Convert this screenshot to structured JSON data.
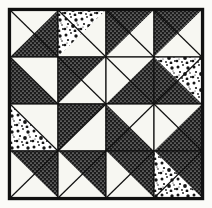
{
  "figure": {
    "title": "Pinwheel Star Quilt Block",
    "media": "black-and-white line drawing",
    "width": 212,
    "height": 208
  },
  "colors": {
    "background": "#fbfbf8",
    "dark_fabric": "#1c1c1c",
    "dark_fabric_dot": "#ffffff",
    "light_fabric": "#f7f7f2",
    "mottled_fabric_base": "#ffffff",
    "mottled_fabric_speck": "#161616",
    "seam_line": "#111111",
    "border_line": "#111111"
  },
  "block": {
    "grid_rows": 4,
    "grid_cols": 4,
    "unit_type": "half-square-triangle",
    "border_inset": 8,
    "border_width": 2,
    "inner_origin_x": 10,
    "inner_origin_y": 10,
    "inner_size": 192,
    "cell_size": 48,
    "center_motif": "pinwheel",
    "fabrics": [
      "dark",
      "light",
      "mottled"
    ],
    "units": [
      {
        "name": "unit-r0c0",
        "row": 0,
        "col": 0,
        "diagonal": "tlbr",
        "upper_fabric": "light",
        "lower_fabric": "dark"
      },
      {
        "name": "unit-r0c1",
        "row": 0,
        "col": 1,
        "diagonal": "tlbr",
        "upper_fabric": "mottled",
        "lower_fabric": "light"
      },
      {
        "name": "unit-r0c2",
        "row": 0,
        "col": 2,
        "diagonal": "tlbr",
        "upper_fabric": "dark",
        "lower_fabric": "light"
      },
      {
        "name": "unit-r0c3",
        "row": 0,
        "col": 3,
        "diagonal": "tlbr",
        "upper_fabric": "dark",
        "lower_fabric": "light"
      },
      {
        "name": "unit-r1c0",
        "row": 1,
        "col": 0,
        "diagonal": "tlbr",
        "upper_fabric": "light",
        "lower_fabric": "dark"
      },
      {
        "name": "unit-r1c1",
        "row": 1,
        "col": 1,
        "diagonal": "tlbr",
        "upper_fabric": "dark",
        "lower_fabric": "light"
      },
      {
        "name": "unit-r1c2",
        "row": 1,
        "col": 2,
        "diagonal": "tlbr",
        "upper_fabric": "light",
        "lower_fabric": "dark"
      },
      {
        "name": "unit-r1c3",
        "row": 1,
        "col": 3,
        "diagonal": "trbl",
        "upper_fabric": "mottled",
        "lower_fabric": "dark"
      },
      {
        "name": "unit-r2c0",
        "row": 2,
        "col": 0,
        "diagonal": "tlbr",
        "upper_fabric": "light",
        "lower_fabric": "mottled"
      },
      {
        "name": "unit-r2c1",
        "row": 2,
        "col": 1,
        "diagonal": "trbl",
        "upper_fabric": "dark",
        "lower_fabric": "light"
      },
      {
        "name": "unit-r2c2",
        "row": 2,
        "col": 2,
        "diagonal": "trbl",
        "upper_fabric": "light",
        "lower_fabric": "dark"
      },
      {
        "name": "unit-r2c3",
        "row": 2,
        "col": 3,
        "diagonal": "tlbr",
        "upper_fabric": "light",
        "lower_fabric": "dark"
      },
      {
        "name": "unit-r3c0",
        "row": 3,
        "col": 0,
        "diagonal": "trbl",
        "upper_fabric": "light",
        "lower_fabric": "dark"
      },
      {
        "name": "unit-r3c1",
        "row": 3,
        "col": 1,
        "diagonal": "trbl",
        "upper_fabric": "light",
        "lower_fabric": "dark"
      },
      {
        "name": "unit-r3c2",
        "row": 3,
        "col": 2,
        "diagonal": "trbl",
        "upper_fabric": "light",
        "lower_fabric": "dark"
      },
      {
        "name": "unit-r3c3",
        "row": 3,
        "col": 3,
        "diagonal": "trbl",
        "upper_fabric": "mottled",
        "lower_fabric": "dark"
      }
    ]
  }
}
